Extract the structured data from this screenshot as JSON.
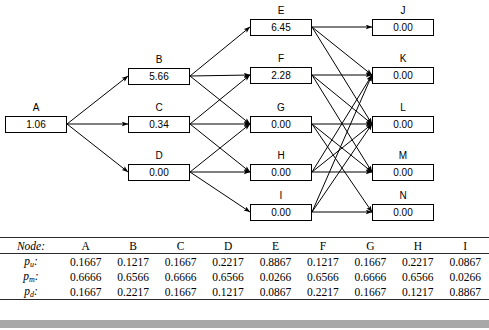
{
  "figure": {
    "type": "lattice-diagram"
  },
  "diagram": {
    "nodes": [
      {
        "id": "A",
        "label": "A",
        "value": "1.06",
        "col": 0,
        "row": 0
      },
      {
        "id": "B",
        "label": "B",
        "value": "5.66",
        "col": 1,
        "row": 0
      },
      {
        "id": "C",
        "label": "C",
        "value": "0.34",
        "col": 1,
        "row": 1
      },
      {
        "id": "D",
        "label": "D",
        "value": "0.00",
        "col": 1,
        "row": 2
      },
      {
        "id": "E",
        "label": "E",
        "value": "6.45",
        "col": 2,
        "row": 0
      },
      {
        "id": "F",
        "label": "F",
        "value": "2.28",
        "col": 2,
        "row": 1
      },
      {
        "id": "G",
        "label": "G",
        "value": "0.00",
        "col": 2,
        "row": 2
      },
      {
        "id": "H",
        "label": "H",
        "value": "0.00",
        "col": 2,
        "row": 3
      },
      {
        "id": "I",
        "label": "I",
        "value": "0.00",
        "col": 2,
        "row": 4
      },
      {
        "id": "J",
        "label": "J",
        "value": "0.00",
        "col": 3,
        "row": 0
      },
      {
        "id": "K",
        "label": "K",
        "value": "0.00",
        "col": 3,
        "row": 1
      },
      {
        "id": "L",
        "label": "L",
        "value": "0.00",
        "col": 3,
        "row": 2
      },
      {
        "id": "M",
        "label": "M",
        "value": "0.00",
        "col": 3,
        "row": 3
      },
      {
        "id": "N",
        "label": "N",
        "value": "0.00",
        "col": 3,
        "row": 4
      }
    ],
    "edges": [
      [
        "A",
        "B"
      ],
      [
        "A",
        "C"
      ],
      [
        "A",
        "D"
      ],
      [
        "B",
        "E"
      ],
      [
        "B",
        "F"
      ],
      [
        "B",
        "G"
      ],
      [
        "C",
        "F"
      ],
      [
        "C",
        "G"
      ],
      [
        "C",
        "H"
      ],
      [
        "D",
        "G"
      ],
      [
        "D",
        "H"
      ],
      [
        "D",
        "I"
      ],
      [
        "E",
        "J"
      ],
      [
        "E",
        "K"
      ],
      [
        "E",
        "L"
      ],
      [
        "F",
        "K"
      ],
      [
        "F",
        "L"
      ],
      [
        "F",
        "M"
      ],
      [
        "G",
        "L"
      ],
      [
        "G",
        "M"
      ],
      [
        "G",
        "N"
      ],
      [
        "H",
        "M"
      ],
      [
        "H",
        "L"
      ],
      [
        "H",
        "K"
      ],
      [
        "I",
        "N"
      ],
      [
        "I",
        "L"
      ],
      [
        "I",
        "K"
      ]
    ],
    "colors": {
      "stroke": "#000000",
      "box_fill": "#ffffff"
    }
  },
  "table": {
    "header_label": "Node:",
    "columns": [
      "A",
      "B",
      "C",
      "D",
      "E",
      "F",
      "G",
      "H",
      "I"
    ],
    "rows": [
      {
        "label_base": "p",
        "label_sub": "u",
        "values": [
          "0.1667",
          "0.1217",
          "0.1667",
          "0.2217",
          "0.8867",
          "0.1217",
          "0.1667",
          "0.2217",
          "0.0867"
        ]
      },
      {
        "label_base": "p",
        "label_sub": "m",
        "values": [
          "0.6666",
          "0.6566",
          "0.6666",
          "0.6566",
          "0.0266",
          "0.6566",
          "0.6666",
          "0.6566",
          "0.0266"
        ]
      },
      {
        "label_base": "p",
        "label_sub": "d",
        "values": [
          "0.1667",
          "0.2217",
          "0.1667",
          "0.1217",
          "0.0867",
          "0.2217",
          "0.1667",
          "0.1217",
          "0.8867"
        ]
      }
    ]
  },
  "footer": {
    "bar_color": "#a8a8a8"
  }
}
